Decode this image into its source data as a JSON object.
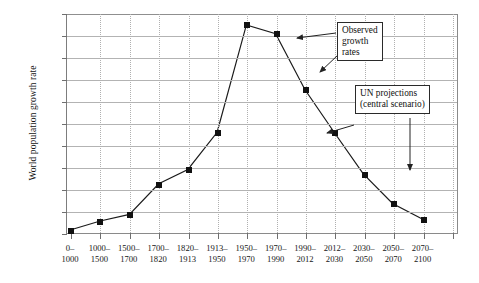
{
  "chart_data": {
    "type": "line",
    "title": "",
    "xlabel": "",
    "ylabel": "World population growth rate",
    "ylim": [
      0.0,
      2.0
    ],
    "ytick_labels": [
      "0.0%",
      "0.2%",
      "0.4%",
      "0.6%",
      "0.8%",
      "1.0%",
      "1.2%",
      "1.4%",
      "1.6%",
      "1.8%",
      "2.0%"
    ],
    "ytick_values": [
      0.0,
      0.2,
      0.4,
      0.6,
      0.8,
      1.0,
      1.2,
      1.4,
      1.6,
      1.8,
      2.0
    ],
    "grid": {
      "horizontal": true,
      "vertical": "dotted"
    },
    "legend": "none",
    "categories": [
      {
        "line1": "0–",
        "line2": "1000"
      },
      {
        "line1": "1000–",
        "line2": "1500"
      },
      {
        "line1": "1500–",
        "line2": "1700"
      },
      {
        "line1": "1700–",
        "line2": "1820"
      },
      {
        "line1": "1820–",
        "line2": "1913"
      },
      {
        "line1": "1913–",
        "line2": "1950"
      },
      {
        "line1": "1950–",
        "line2": "1970"
      },
      {
        "line1": "1970–",
        "line2": "1990"
      },
      {
        "line1": "1990–",
        "line2": "2012"
      },
      {
        "line1": "2012–",
        "line2": "2030"
      },
      {
        "line1": "2030–",
        "line2": "2050"
      },
      {
        "line1": "2050–",
        "line2": "2070"
      },
      {
        "line1": "2070–",
        "line2": "2100"
      }
    ],
    "values": [
      0.03,
      0.11,
      0.17,
      0.45,
      0.58,
      0.92,
      1.9,
      1.82,
      1.31,
      0.92,
      0.54,
      0.27,
      0.13
    ],
    "series": [
      {
        "name": "World population growth rate",
        "marker": "square",
        "color": "#111111",
        "values": [
          0.03,
          0.11,
          0.17,
          0.45,
          0.58,
          0.92,
          1.9,
          1.82,
          1.31,
          0.92,
          0.54,
          0.27,
          0.13
        ]
      }
    ],
    "annotations": [
      {
        "id": "observed",
        "lines": [
          "Observed",
          "growth",
          "rates"
        ],
        "points_to": [
          "1950–1970 / 1970–1990 region",
          "1990–2012 region"
        ]
      },
      {
        "id": "un-projections",
        "lines": [
          "UN  projections",
          "(central scenario)"
        ],
        "points_to": [
          "1990–2012 marker",
          "2030–2050 region"
        ]
      }
    ]
  },
  "caption": ""
}
